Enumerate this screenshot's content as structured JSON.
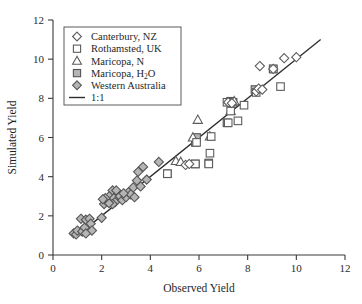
{
  "chart_data": {
    "type": "scatter",
    "title": "",
    "xlabel": "Observed Yield",
    "ylabel": "Simulated Yield",
    "xlim": [
      0,
      12
    ],
    "ylim": [
      0,
      12
    ],
    "xticks": [
      0,
      2,
      4,
      6,
      8,
      10,
      12
    ],
    "yticks": [
      0,
      2,
      4,
      6,
      8,
      10,
      12
    ],
    "grid": false,
    "legend_position": "top-left",
    "reference_line": {
      "label": "1:1",
      "slope": 1,
      "intercept": 0,
      "x_start": 0.9,
      "x_end": 11.0
    },
    "series": [
      {
        "name": "Canterbury, NZ",
        "marker": "diamond-open",
        "fill": "#ffffff",
        "edge": "#5c5c5c",
        "points": [
          [
            7.2,
            7.8
          ],
          [
            7.35,
            7.75
          ],
          [
            8.35,
            8.35
          ],
          [
            8.45,
            8.5
          ],
          [
            8.5,
            9.65
          ],
          [
            8.6,
            8.45
          ],
          [
            9.05,
            9.5
          ],
          [
            9.5,
            10.05
          ],
          [
            10.0,
            10.1
          ],
          [
            5.45,
            4.6
          ],
          [
            5.6,
            4.65
          ]
        ]
      },
      {
        "name": "Rothamsted, UK",
        "marker": "square-open",
        "fill": "#ffffff",
        "edge": "#5c5c5c",
        "points": [
          [
            4.7,
            4.15
          ],
          [
            5.9,
            5.75
          ],
          [
            5.85,
            4.65
          ],
          [
            6.45,
            5.2
          ],
          [
            6.4,
            4.65
          ],
          [
            7.2,
            6.75
          ],
          [
            7.3,
            7.35
          ],
          [
            7.6,
            6.85
          ],
          [
            7.85,
            7.65
          ],
          [
            8.35,
            8.3
          ],
          [
            9.05,
            9.5
          ],
          [
            9.35,
            8.6
          ],
          [
            7.15,
            7.8
          ],
          [
            6.5,
            6.05
          ]
        ]
      },
      {
        "name": "Maricopa, N",
        "marker": "triangle-open",
        "fill": "#ffffff",
        "edge": "#5c5c5c",
        "points": [
          [
            5.05,
            4.8
          ],
          [
            5.25,
            4.75
          ],
          [
            5.95,
            6.9
          ],
          [
            6.45,
            6.05
          ],
          [
            7.3,
            7.35
          ],
          [
            5.75,
            6.0
          ],
          [
            7.45,
            7.85
          ]
        ]
      },
      {
        "name": "Maricopa, H2O",
        "marker": "square-filled",
        "fill": "#b5b5b5",
        "edge": "#555555",
        "points": [
          [
            4.7,
            4.15
          ],
          [
            5.85,
            5.75
          ],
          [
            5.85,
            4.65
          ],
          [
            7.15,
            6.75
          ],
          [
            7.4,
            7.8
          ],
          [
            7.3,
            7.85
          ],
          [
            8.3,
            8.45
          ],
          [
            9.05,
            9.5
          ],
          [
            5.9,
            6.0
          ],
          [
            6.4,
            4.7
          ]
        ]
      },
      {
        "name": "Western Australia",
        "marker": "diamond-filled",
        "fill": "#b5b5b5",
        "edge": "#555555",
        "points": [
          [
            0.85,
            1.1
          ],
          [
            0.95,
            1.05
          ],
          [
            1.0,
            1.25
          ],
          [
            1.15,
            1.85
          ],
          [
            1.2,
            1.2
          ],
          [
            1.3,
            1.4
          ],
          [
            1.35,
            1.8
          ],
          [
            1.5,
            1.85
          ],
          [
            1.55,
            1.6
          ],
          [
            1.6,
            1.25
          ],
          [
            1.35,
            1.1
          ],
          [
            2.0,
            1.9
          ],
          [
            2.1,
            2.6
          ],
          [
            2.2,
            2.75
          ],
          [
            2.25,
            2.85
          ],
          [
            2.3,
            2.9
          ],
          [
            2.35,
            3.05
          ],
          [
            2.4,
            2.75
          ],
          [
            2.45,
            3.3
          ],
          [
            2.5,
            2.9
          ],
          [
            2.55,
            2.7
          ],
          [
            2.6,
            3.3
          ],
          [
            2.45,
            2.6
          ],
          [
            2.3,
            2.65
          ],
          [
            2.15,
            2.9
          ],
          [
            2.75,
            3.0
          ],
          [
            2.85,
            2.8
          ],
          [
            3.0,
            2.95
          ],
          [
            3.1,
            3.2
          ],
          [
            3.2,
            3.1
          ],
          [
            3.3,
            3.45
          ],
          [
            3.45,
            3.8
          ],
          [
            3.5,
            4.25
          ],
          [
            3.6,
            3.5
          ],
          [
            3.7,
            4.5
          ],
          [
            3.85,
            3.85
          ],
          [
            4.35,
            4.75
          ],
          [
            2.9,
            3.15
          ],
          [
            3.35,
            2.95
          ],
          [
            2.05,
            2.85
          ]
        ]
      }
    ]
  },
  "legend": {
    "entries": [
      {
        "label": "Canterbury, NZ",
        "marker": "diamond-open"
      },
      {
        "label": "Rothamsted, UK",
        "marker": "square-open"
      },
      {
        "label": "Maricopa, N",
        "marker": "triangle-open"
      },
      {
        "label": "Maricopa, H",
        "sub": "2",
        "label_tail": "O",
        "marker": "square-filled"
      },
      {
        "label": "Western Australia",
        "marker": "diamond-filled"
      },
      {
        "label": "1:1",
        "marker": "line"
      }
    ]
  }
}
